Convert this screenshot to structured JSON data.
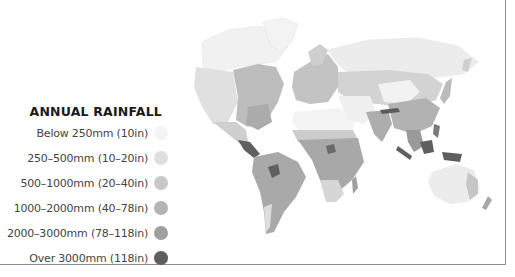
{
  "legend": {
    "title": "ANNUAL RAINFALL",
    "items": [
      {
        "label": "Below 250mm (10in)",
        "color": "#f4f4f4"
      },
      {
        "label": "250–500mm (10–20in)",
        "color": "#dedede"
      },
      {
        "label": "500–1000mm (20–40in)",
        "color": "#c8c8c8"
      },
      {
        "label": "1000–2000mm (40–78in)",
        "color": "#b4b4b4"
      },
      {
        "label": "2000–3000mm (78–118in)",
        "color": "#9f9f9f"
      },
      {
        "label": "Over 3000mm (118in)",
        "color": "#5f5f5f"
      }
    ]
  },
  "map": {
    "subject": "World map of annual rainfall",
    "regions": [
      {
        "name": "North America",
        "shade": "mixed"
      },
      {
        "name": "Central America",
        "shade": "Over 3000mm"
      },
      {
        "name": "South America",
        "shade": "1000–3000mm"
      },
      {
        "name": "Europe",
        "shade": "500–1000mm"
      },
      {
        "name": "Africa",
        "shade": "mixed"
      },
      {
        "name": "Asia",
        "shade": "mixed"
      },
      {
        "name": "Southeast Asia",
        "shade": "Over 3000mm"
      },
      {
        "name": "Australia",
        "shade": "Below 500mm"
      }
    ]
  }
}
